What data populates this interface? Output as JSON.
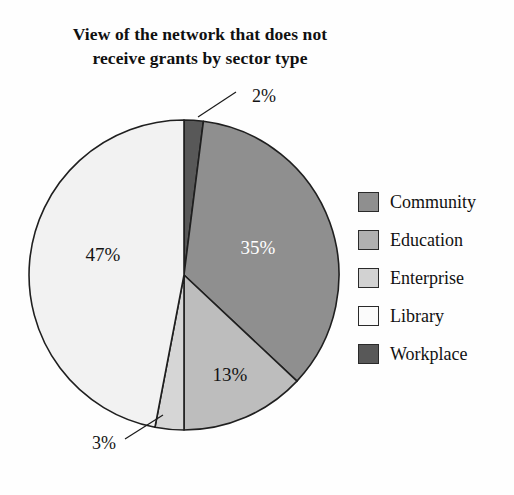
{
  "chart_data": {
    "type": "pie",
    "title": "View of the network that does not receive grants by sector type",
    "title_lines": [
      "View of the network that does not",
      "receive grants by sector type"
    ],
    "xlabel": "",
    "ylabel": "",
    "grid": false,
    "legend_position": "right",
    "units": "percent",
    "start_angle_deg": 0,
    "direction": "clockwise",
    "categories": [
      "Workplace",
      "Community",
      "Education",
      "Enterprise",
      "Library"
    ],
    "values": [
      2,
      35,
      13,
      3,
      47
    ],
    "data_labels": [
      "2%",
      "35%",
      "13%",
      "3%",
      "47%"
    ],
    "slices": [
      {
        "name": "Workplace",
        "value": 2,
        "label": "2%",
        "color": "#585858",
        "label_style": "callout",
        "label_x": 252,
        "label_y": 38,
        "leader": "M 236 32 L 198 57",
        "text_anchor": "start"
      },
      {
        "name": "Community",
        "value": 35,
        "label": "35%",
        "color": "#8f8f8f",
        "label_style": "inside-light",
        "label_x": 258,
        "label_y": 190,
        "text_anchor": "middle"
      },
      {
        "name": "Education",
        "value": 13,
        "label": "13%",
        "color": "#bdbdbd",
        "label_style": "inside-dark",
        "label_x": 230,
        "label_y": 317,
        "text_anchor": "middle"
      },
      {
        "name": "Enterprise",
        "value": 3,
        "label": "3%",
        "color": "#d6d6d6",
        "label_style": "callout",
        "label_x": 92,
        "label_y": 385,
        "leader": "M 125 379 L 163 355",
        "text_anchor": "start"
      },
      {
        "name": "Library",
        "value": 47,
        "label": "47%",
        "color": "#f2f2f2",
        "label_style": "inside-dark",
        "label_x": 103,
        "label_y": 197,
        "text_anchor": "middle"
      }
    ],
    "geometry": {
      "center_x": 184,
      "center_y": 215,
      "radius": 155,
      "outline_color": "#1f1f1f",
      "outline_width": 1.6
    }
  },
  "legend": {
    "items": [
      {
        "label": "Community",
        "color": "#8f8f8f"
      },
      {
        "label": "Education",
        "color": "#b0b0b0"
      },
      {
        "label": "Enterprise",
        "color": "#d2d2d2"
      },
      {
        "label": "Library",
        "color": "#fbfbfb"
      },
      {
        "label": "Workplace",
        "color": "#585858"
      }
    ]
  }
}
